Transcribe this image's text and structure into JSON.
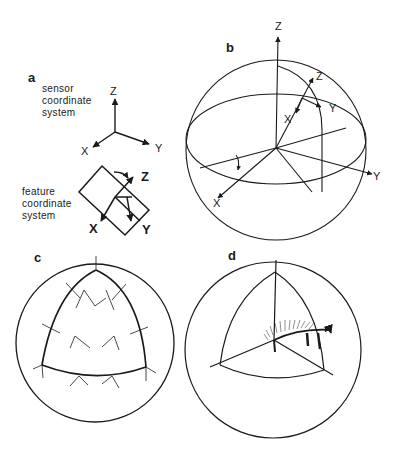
{
  "figure": {
    "panels": [
      {
        "id": "a",
        "label": "a",
        "sensor_caption": [
          "sensor",
          "coordinate",
          "system"
        ],
        "sensor_axes": {
          "z": "Z",
          "x": "X",
          "y": "Y"
        },
        "feature_caption": [
          "feature",
          "coordinate",
          "system"
        ],
        "feature_axes": {
          "z": "Z",
          "x": "X",
          "y": "Y"
        }
      },
      {
        "id": "b",
        "label": "b",
        "global_axes": {
          "z": "Z",
          "x": "X",
          "y": "Y"
        },
        "local_axes": {
          "z": "Z",
          "x": "X",
          "y": "Y"
        }
      },
      {
        "id": "c",
        "label": "c"
      },
      {
        "id": "d",
        "label": "d"
      }
    ],
    "line_color": "#1a1a1a",
    "background": "#ffffff"
  }
}
